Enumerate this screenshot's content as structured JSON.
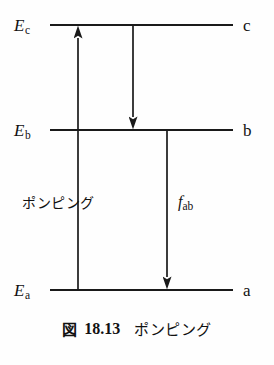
{
  "figure": {
    "title_visible": false,
    "background_color": "#fefefe",
    "stroke_color": "#1a1a1a",
    "text_color": "#111111"
  },
  "diagram": {
    "type": "energy-level-diagram",
    "levels": [
      {
        "id": "c",
        "energy_label": "E",
        "energy_subscript": "c",
        "state_label": "c",
        "y": 25,
        "x_start": 50,
        "x_end": 233
      },
      {
        "id": "b",
        "energy_label": "E",
        "energy_subscript": "b",
        "state_label": "b",
        "y": 130,
        "x_start": 50,
        "x_end": 233
      },
      {
        "id": "a",
        "energy_label": "E",
        "energy_subscript": "a",
        "state_label": "a",
        "y": 290,
        "x_start": 50,
        "x_end": 233
      }
    ],
    "transitions": [
      {
        "id": "pumping",
        "from_level": "a",
        "to_level": "c",
        "direction": "up",
        "x": 78,
        "y_start": 290,
        "y_end": 25,
        "label": "ポンピング",
        "label_x": 22,
        "label_y": 196
      },
      {
        "id": "relaxation-c-to-b",
        "from_level": "c",
        "to_level": "b",
        "direction": "down",
        "x": 133,
        "y_start": 25,
        "y_end": 130,
        "label": "",
        "label_x": null,
        "label_y": null
      },
      {
        "id": "emission-b-to-a",
        "from_level": "b",
        "to_level": "a",
        "direction": "down",
        "x": 167,
        "y_start": 130,
        "y_end": 290,
        "label": "f",
        "label_subscript": "ab",
        "label_x": 178,
        "label_y": 196
      }
    ]
  },
  "caption": {
    "figure_word": "図",
    "figure_number": "18.13",
    "figure_text": "ポンピング"
  }
}
